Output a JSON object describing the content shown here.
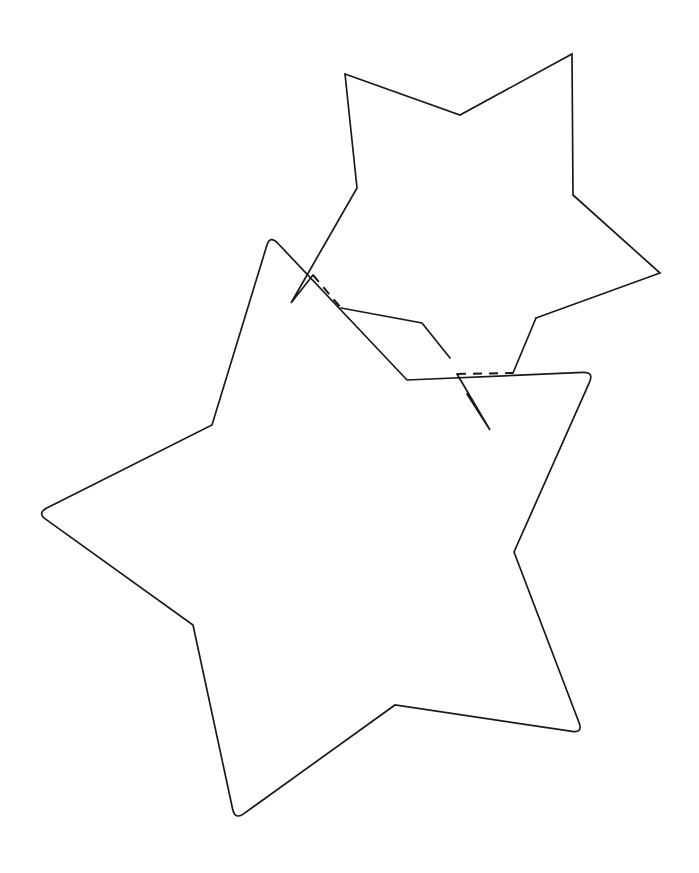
{
  "figure": {
    "title": "Two overlapping five-pointed star outlines",
    "background_color": "#ffffff",
    "stroke_color": "#1a1a1a",
    "width": 699,
    "height": 873,
    "shape_count": 2
  },
  "shapes": [
    {
      "id": "star-upper-right",
      "name": "upper-right-star",
      "label": "Upper right star",
      "points": 5,
      "corner_style": "sharp",
      "stroke_width": 1.7,
      "occluded": true,
      "outline": [
        [
          345,
          74
        ],
        [
          460,
          115
        ],
        [
          572,
          54
        ],
        [
          573,
          195
        ],
        [
          660,
          273
        ],
        [
          536,
          318
        ],
        [
          490,
          430
        ],
        [
          422,
          323
        ],
        [
          291,
          303
        ],
        [
          357,
          188
        ]
      ],
      "visible_segments": [
        "M345,74 L460,115 L572,54 L573,195 L660,273 L536,318",
        "M536,318 L513,373",
        "M457,374 L490,430 L467,394",
        "M450,358 L422,323 L341,308",
        "M313,275 L291,303 L357,188 L345,74"
      ]
    },
    {
      "id": "star-lower-left",
      "name": "lower-left-star",
      "label": "Lower left star",
      "points": 5,
      "corner_style": "rounded-tips",
      "tip_corner_radius": 11,
      "stroke_width": 1.7,
      "occluded": false,
      "outline": [
        [
          270,
          235
        ],
        [
          407,
          380
        ],
        [
          594,
          372
        ],
        [
          514,
          552
        ],
        [
          583,
          733
        ],
        [
          395,
          705
        ],
        [
          235,
          820
        ],
        [
          193,
          625
        ],
        [
          37,
          513
        ],
        [
          212,
          425
        ]
      ]
    }
  ],
  "hidden_lines": {
    "style": "dashed",
    "dash_pattern": "9 7",
    "stroke_width": 2.0,
    "segments": [
      {
        "name": "hidden-edge-upper-left",
        "from": [
          313,
          275
        ],
        "to": [
          341,
          308
        ]
      },
      {
        "name": "hidden-edge-lower-right",
        "from": [
          457,
          374
        ],
        "to": [
          513,
          373
        ]
      }
    ]
  }
}
